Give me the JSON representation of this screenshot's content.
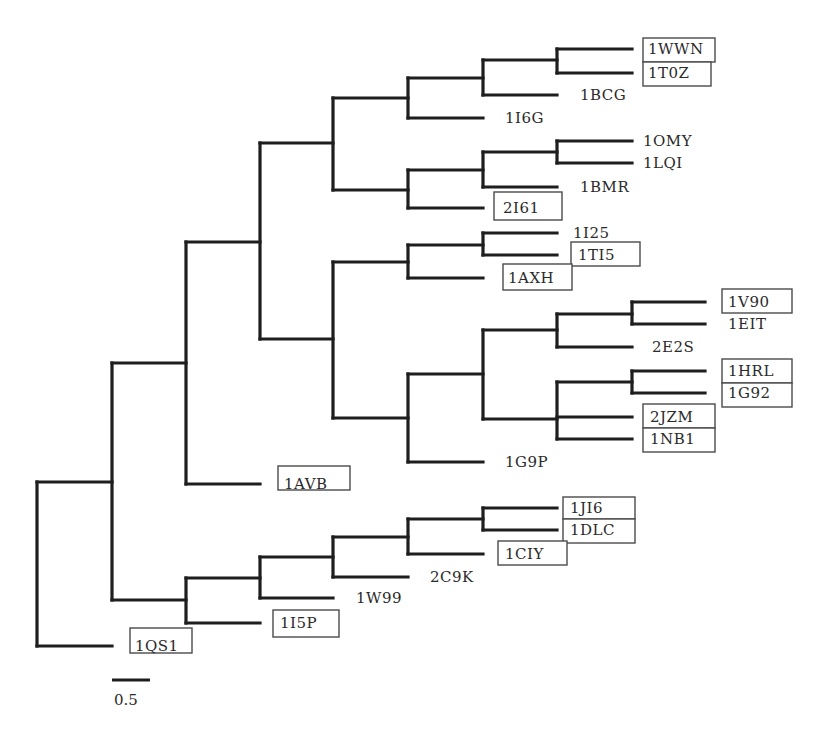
{
  "figure": {
    "type": "phylogenetic-tree",
    "orientation": "left-to-right",
    "branch_color": "#1e1e1e",
    "box_color": "#4a4a4a",
    "text_color": "#2a2a2a"
  },
  "scale_bar": {
    "label": "0.5",
    "x1": 112,
    "x2": 150,
    "y": 680,
    "label_x": 114,
    "label_y": 705
  },
  "branches": [
    [
      37,
      482,
      37,
      646
    ],
    [
      37,
      482,
      112,
      482
    ],
    [
      37,
      646,
      112,
      646
    ],
    [
      112,
      363,
      112,
      600
    ],
    [
      112,
      363,
      186,
      363
    ],
    [
      112,
      600,
      186,
      600
    ],
    [
      186,
      242,
      186,
      484
    ],
    [
      186,
      242,
      260,
      242
    ],
    [
      186,
      484,
      260,
      484
    ],
    [
      260,
      143,
      260,
      339
    ],
    [
      260,
      143,
      333,
      143
    ],
    [
      260,
      339,
      333,
      339
    ],
    [
      333,
      98,
      333,
      190
    ],
    [
      333,
      98,
      408,
      98
    ],
    [
      333,
      190,
      408,
      190
    ],
    [
      408,
      78,
      408,
      118
    ],
    [
      408,
      78,
      483,
      78
    ],
    [
      408,
      118,
      483,
      118
    ],
    [
      483,
      60,
      483,
      95
    ],
    [
      483,
      60,
      557,
      60
    ],
    [
      483,
      95,
      557,
      95
    ],
    [
      557,
      49,
      557,
      73
    ],
    [
      557,
      49,
      632,
      49
    ],
    [
      557,
      73,
      632,
      73
    ],
    [
      408,
      170,
      408,
      208
    ],
    [
      408,
      170,
      483,
      170
    ],
    [
      408,
      208,
      483,
      208
    ],
    [
      483,
      152,
      483,
      187
    ],
    [
      483,
      152,
      557,
      152
    ],
    [
      483,
      187,
      557,
      187
    ],
    [
      557,
      141,
      557,
      163
    ],
    [
      557,
      141,
      632,
      141
    ],
    [
      557,
      163,
      632,
      163
    ],
    [
      333,
      262,
      333,
      418
    ],
    [
      333,
      262,
      408,
      262
    ],
    [
      333,
      418,
      408,
      418
    ],
    [
      408,
      245,
      408,
      278
    ],
    [
      408,
      245,
      483,
      245
    ],
    [
      408,
      278,
      483,
      278
    ],
    [
      483,
      233,
      483,
      255
    ],
    [
      483,
      233,
      557,
      233
    ],
    [
      483,
      255,
      557,
      255
    ],
    [
      408,
      374,
      408,
      462
    ],
    [
      408,
      374,
      483,
      374
    ],
    [
      408,
      462,
      483,
      462
    ],
    [
      483,
      330,
      483,
      419
    ],
    [
      483,
      330,
      557,
      330
    ],
    [
      483,
      419,
      557,
      419
    ],
    [
      557,
      314,
      557,
      347
    ],
    [
      557,
      314,
      632,
      314
    ],
    [
      557,
      347,
      632,
      347
    ],
    [
      632,
      302,
      632,
      324
    ],
    [
      632,
      302,
      705,
      302
    ],
    [
      632,
      324,
      705,
      324
    ],
    [
      557,
      382,
      557,
      439
    ],
    [
      557,
      382,
      632,
      382
    ],
    [
      557,
      439,
      632,
      439
    ],
    [
      557,
      417,
      632,
      417
    ],
    [
      632,
      371,
      632,
      393
    ],
    [
      632,
      371,
      705,
      371
    ],
    [
      632,
      393,
      705,
      393
    ],
    [
      186,
      578,
      186,
      623
    ],
    [
      186,
      578,
      260,
      578
    ],
    [
      186,
      623,
      260,
      623
    ],
    [
      260,
      557,
      260,
      598
    ],
    [
      260,
      557,
      333,
      557
    ],
    [
      260,
      598,
      333,
      598
    ],
    [
      333,
      537,
      333,
      577
    ],
    [
      333,
      537,
      408,
      537
    ],
    [
      333,
      577,
      408,
      577
    ],
    [
      408,
      519,
      408,
      554
    ],
    [
      408,
      519,
      483,
      519
    ],
    [
      408,
      554,
      483,
      554
    ],
    [
      483,
      508,
      483,
      530
    ],
    [
      483,
      508,
      557,
      508
    ],
    [
      483,
      530,
      557,
      530
    ]
  ],
  "leaves": [
    {
      "name": "1WWN",
      "x": 648,
      "y": 49,
      "boxed": true,
      "box": [
        643,
        38,
        72,
        24
      ]
    },
    {
      "name": "1T0Z",
      "x": 648,
      "y": 73,
      "boxed": true,
      "box": [
        643,
        62,
        68,
        24
      ]
    },
    {
      "name": "1BCG",
      "x": 580,
      "y": 95,
      "boxed": false
    },
    {
      "name": "1I6G",
      "x": 505,
      "y": 118,
      "boxed": false
    },
    {
      "name": "1OMY",
      "x": 643,
      "y": 141,
      "boxed": false
    },
    {
      "name": "1LQI",
      "x": 643,
      "y": 163,
      "boxed": false
    },
    {
      "name": "1BMR",
      "x": 580,
      "y": 187,
      "boxed": false
    },
    {
      "name": "2I61",
      "x": 503,
      "y": 208,
      "boxed": true,
      "box": [
        494,
        192,
        68,
        28
      ]
    },
    {
      "name": "1I25",
      "x": 573,
      "y": 233,
      "boxed": false
    },
    {
      "name": "1TI5",
      "x": 578,
      "y": 255,
      "boxed": true,
      "box": [
        571,
        242,
        69,
        24
      ]
    },
    {
      "name": "1AXH",
      "x": 508,
      "y": 278,
      "boxed": true,
      "box": [
        503,
        264,
        69,
        26
      ]
    },
    {
      "name": "1V90",
      "x": 728,
      "y": 302,
      "boxed": true,
      "box": [
        722,
        289,
        70,
        24
      ]
    },
    {
      "name": "1EIT",
      "x": 728,
      "y": 324,
      "boxed": false
    },
    {
      "name": "2E2S",
      "x": 652,
      "y": 347,
      "boxed": false
    },
    {
      "name": "1HRL",
      "x": 728,
      "y": 371,
      "boxed": true,
      "box": [
        722,
        359,
        70,
        24
      ]
    },
    {
      "name": "1G92",
      "x": 728,
      "y": 393,
      "boxed": true,
      "box": [
        722,
        383,
        70,
        24
      ]
    },
    {
      "name": "2JZM",
      "x": 650,
      "y": 417,
      "boxed": true,
      "box": [
        643,
        404,
        72,
        24
      ]
    },
    {
      "name": "1NB1",
      "x": 650,
      "y": 439,
      "boxed": true,
      "box": [
        643,
        428,
        72,
        24
      ]
    },
    {
      "name": "1G9P",
      "x": 505,
      "y": 462,
      "boxed": false
    },
    {
      "name": "1AVB",
      "x": 284,
      "y": 484,
      "boxed": true,
      "box": [
        278,
        466,
        72,
        24
      ]
    },
    {
      "name": "1JI6",
      "x": 570,
      "y": 508,
      "boxed": true,
      "box": [
        563,
        497,
        72,
        22
      ]
    },
    {
      "name": "1DLC",
      "x": 570,
      "y": 530,
      "boxed": true,
      "box": [
        563,
        519,
        72,
        24
      ]
    },
    {
      "name": "1CIY",
      "x": 505,
      "y": 554,
      "boxed": true,
      "box": [
        498,
        541,
        69,
        24
      ]
    },
    {
      "name": "2C9K",
      "x": 430,
      "y": 577,
      "boxed": false
    },
    {
      "name": "1W99",
      "x": 356,
      "y": 598,
      "boxed": false
    },
    {
      "name": "1I5P",
      "x": 280,
      "y": 623,
      "boxed": true,
      "box": [
        273,
        610,
        66,
        27
      ]
    },
    {
      "name": "1QS1",
      "x": 135,
      "y": 646,
      "boxed": true,
      "box": [
        130,
        628,
        62,
        25
      ]
    }
  ]
}
